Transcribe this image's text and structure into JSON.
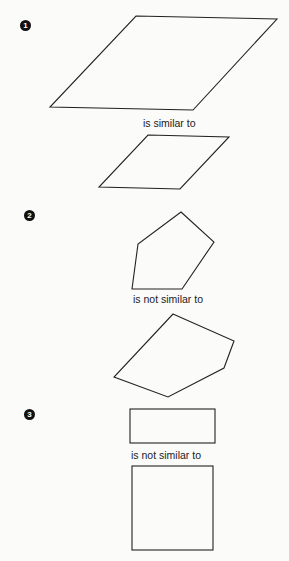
{
  "examples": [
    {
      "number": "1",
      "relation": "is similar to",
      "shape_a": {
        "type": "parallelogram",
        "points": "136,16 277,19 193,110 50,107"
      },
      "shape_b": {
        "type": "parallelogram",
        "points": "148,135 229,137 180,189 99,187"
      }
    },
    {
      "number": "2",
      "relation": "is not similar to",
      "shape_a": {
        "type": "pentagon",
        "points": "181,212 214,242 182,289 132,289 138,244"
      },
      "shape_b": {
        "type": "pentagon",
        "points": "173,314 234,341 224,368 168,397 114,377"
      }
    },
    {
      "number": "3",
      "relation": "is not similar to",
      "shape_a": {
        "type": "rectangle",
        "x": 130,
        "y": 409,
        "width": 85,
        "height": 34
      },
      "shape_b": {
        "type": "rectangle",
        "x": 132,
        "y": 466,
        "width": 81,
        "height": 84
      }
    }
  ],
  "colors": {
    "stroke": "#222222",
    "background": "#fbfbf9"
  }
}
